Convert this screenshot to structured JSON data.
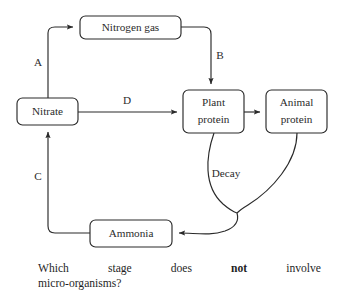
{
  "diagram": {
    "nodes": [
      {
        "id": "nitrogen-gas",
        "label": "Nitrogen gas",
        "x": 80,
        "y": 16,
        "w": 101,
        "h": 23
      },
      {
        "id": "nitrate",
        "label": "Nitrate",
        "x": 17,
        "y": 98,
        "w": 61,
        "h": 27
      },
      {
        "id": "plant-protein",
        "label": "Plant\nprotein",
        "x": 183,
        "y": 90,
        "w": 61,
        "h": 43
      },
      {
        "id": "animal-protein",
        "label": "Animal\nprotein",
        "x": 266,
        "y": 90,
        "w": 61,
        "h": 43
      },
      {
        "id": "ammonia",
        "label": "Ammonia",
        "x": 90,
        "y": 220,
        "w": 82,
        "h": 27
      }
    ],
    "node_text": {
      "nitrogen_gas": "Nitrogen gas",
      "nitrate": "Nitrate",
      "plant_protein_line1": "Plant",
      "plant_protein_line2": "protein",
      "animal_protein_line1": "Animal",
      "animal_protein_line2": "protein",
      "ammonia": "Ammonia"
    },
    "edge_labels": {
      "a": "A",
      "b": "B",
      "c": "C",
      "d": "D",
      "decay": "Decay"
    },
    "edges": [
      {
        "id": "nitrate-to-nitrogen-gas",
        "label": "A",
        "from": "nitrate",
        "to": "nitrogen-gas"
      },
      {
        "id": "nitrogen-gas-to-plant",
        "label": "B",
        "from": "nitrogen-gas",
        "to": "plant-protein"
      },
      {
        "id": "ammonia-to-nitrate",
        "label": "C",
        "from": "ammonia",
        "to": "nitrate"
      },
      {
        "id": "nitrate-to-plant",
        "label": "D",
        "from": "nitrate",
        "to": "plant-protein"
      },
      {
        "id": "plant-to-animal",
        "label": "",
        "from": "plant-protein",
        "to": "animal-protein"
      },
      {
        "id": "decay-to-ammonia",
        "label": "Decay",
        "from": "plant-protein, animal-protein",
        "to": "ammonia"
      }
    ],
    "stroke_color": "#2a2a2a",
    "background_color": "#ffffff"
  },
  "question": {
    "line1_words": [
      "Which",
      "stage",
      "does",
      "not",
      "involve"
    ],
    "bold_word": "not",
    "line2": "micro-organisms?"
  }
}
